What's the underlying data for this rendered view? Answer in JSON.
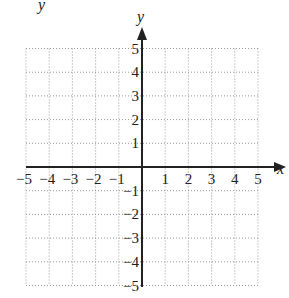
{
  "header": {
    "cropped_label": "y"
  },
  "chart_data": {
    "type": "coordinate-grid",
    "title": "",
    "xlabel": "x",
    "ylabel": "y",
    "xlim": [
      -5,
      5
    ],
    "ylim": [
      -5,
      5
    ],
    "grid": true,
    "grid_style": "dotted",
    "x_ticks": [
      "−5",
      "−4",
      "−3",
      "−2",
      "−1",
      "1",
      "2",
      "3",
      "4",
      "5"
    ],
    "y_ticks": [
      "5",
      "4",
      "3",
      "2",
      "1",
      "−1",
      "−2",
      "−3",
      "−4",
      "−5"
    ],
    "series": []
  },
  "colors": {
    "axis": "#222222",
    "grid": "#9a9a9a",
    "text": "#222222"
  }
}
